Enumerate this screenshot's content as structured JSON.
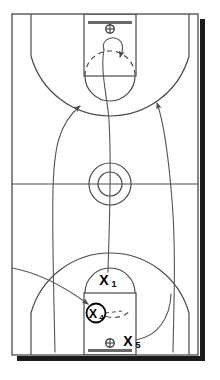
{
  "diagram": {
    "type": "basketball-play",
    "court_orientation": "vertical-full-court",
    "colors": {
      "court_line": "#4a4a4a",
      "court_line_heavy": "#333333",
      "path_line": "#555555",
      "marker": "#000000",
      "background": "#ffffff",
      "shadow": "#1a1a1a"
    },
    "court": {
      "boundary": {
        "x": 12,
        "y": 14,
        "width": 186,
        "height": 341
      },
      "halfcourt_line_y": 184,
      "shadow_offset": 5
    },
    "baskets": [
      {
        "name": "top-basket",
        "backboard": {
          "cx": 110,
          "y": 22,
          "width": 44
        },
        "hoop": {
          "cx": 110,
          "cy": 29,
          "r": 4
        }
      },
      {
        "name": "bottom-basket",
        "backboard": {
          "cx": 110,
          "y": 349,
          "width": 44
        },
        "hoop": {
          "cx": 110,
          "cy": 343,
          "r": 4
        }
      }
    ],
    "keys": [
      {
        "name": "top-key",
        "x": 84,
        "y": 14,
        "width": 52,
        "height": 62,
        "ft_circle": {
          "cx": 110,
          "cy": 76,
          "r": 25
        }
      },
      {
        "name": "bottom-key",
        "x": 84,
        "y": 293,
        "width": 52,
        "height": 62,
        "ft_circle": {
          "cx": 110,
          "cy": 293,
          "r": 25
        }
      }
    ],
    "center_circle": {
      "cx": 110,
      "cy": 184,
      "r_outer": 21,
      "r_inner": 12
    },
    "three_point_arcs": [
      {
        "name": "top-three-point-line",
        "cy": 29,
        "r": 82
      },
      {
        "name": "bottom-three-point-line",
        "cy": 343,
        "r": 82
      }
    ]
  },
  "players": [
    {
      "id": "X1",
      "label_letter": "X",
      "label_number": "1",
      "x": 110,
      "y": 280,
      "circled": false,
      "role": "point-guard-ball-handler"
    },
    {
      "id": "X4",
      "label_letter": "X",
      "label_number": "4",
      "x": 96,
      "y": 313,
      "circled": true,
      "role": "post-screener"
    },
    {
      "id": "X5",
      "label_letter": "X",
      "label_number": "5",
      "x": 130,
      "y": 341,
      "circled": false,
      "role": "low-post"
    }
  ],
  "movement_paths": [
    {
      "name": "center-drive-path",
      "description": "X1 drives straight up through the middle to the top key",
      "style": "solid",
      "arrowhead": false,
      "from": "X1",
      "to": "top-key"
    },
    {
      "name": "top-loop-path",
      "description": "Loop curl at the top key with arrowhead pointing down",
      "style": "solid",
      "arrowhead": true,
      "arrow_at": {
        "x": 120,
        "y": 58
      }
    },
    {
      "name": "left-wing-path",
      "description": "Curved cut from bottom-left corner up to the left elbow",
      "style": "solid",
      "arrowhead": true,
      "arrow_at": {
        "x": 80,
        "y": 104
      }
    },
    {
      "name": "right-wing-path",
      "description": "Curved cut from bottom-right corner up to the right elbow",
      "style": "solid",
      "arrowhead": true,
      "arrow_at": {
        "x": 157,
        "y": 100
      }
    },
    {
      "name": "x4-screen-path",
      "description": "Path leading into X4 screen position",
      "style": "solid",
      "arrowhead": true,
      "arrow_at": {
        "x": 92,
        "y": 305
      }
    },
    {
      "name": "x4-dashed-cut",
      "description": "Dashed screen indicator to the right of X4",
      "style": "dashed",
      "arrowhead": false
    },
    {
      "name": "top-dashed-arc",
      "description": "Dashed upper half of the top free-throw circle",
      "style": "dashed",
      "arrowhead": false
    }
  ]
}
